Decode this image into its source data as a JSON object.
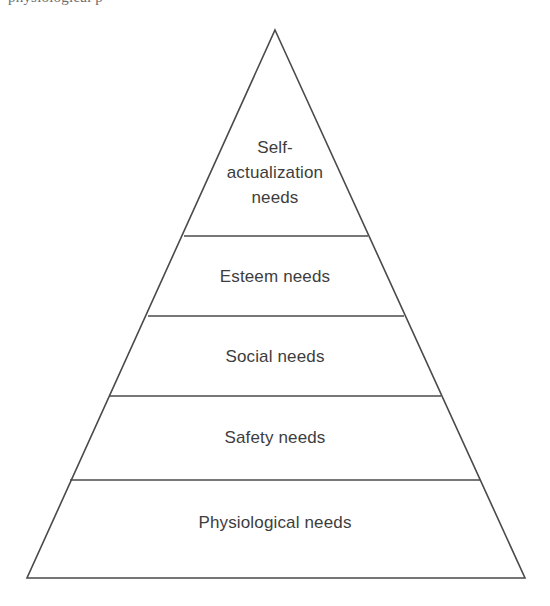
{
  "diagram": {
    "type": "pyramid",
    "top_text_fragment": "physiological p",
    "stroke_color": "#4a4a4a",
    "fill_color": "#ffffff",
    "background_color": "#ffffff",
    "apex": {
      "x": 275,
      "y": 30
    },
    "base_left": {
      "x": 27,
      "y": 578
    },
    "base_right": {
      "x": 525,
      "y": 578
    },
    "tiers": [
      {
        "id": "self-actualization",
        "label": "Self-\nactualization\nneeds",
        "order": 1,
        "level": "top",
        "divider_y": 236,
        "divider_x_start": 184,
        "divider_x_end": 368,
        "label_center_x": 275,
        "label_top_y": 135
      },
      {
        "id": "esteem",
        "label": "Esteem needs",
        "order": 2,
        "level": "fourth",
        "divider_y": 316,
        "divider_x_start": 148,
        "divider_x_end": 404,
        "label_center_x": 275,
        "label_top_y": 265
      },
      {
        "id": "social",
        "label": "Social needs",
        "order": 3,
        "level": "third",
        "divider_y": 396,
        "divider_x_start": 110,
        "divider_x_end": 441,
        "label_center_x": 275,
        "label_top_y": 345
      },
      {
        "id": "safety",
        "label": "Safety needs",
        "order": 4,
        "level": "second",
        "divider_y": 480,
        "divider_x_start": 70,
        "divider_x_end": 480,
        "label_center_x": 275,
        "label_top_y": 426
      },
      {
        "id": "physiological",
        "label": "Physiological needs",
        "order": 5,
        "level": "base",
        "divider_y": null,
        "divider_x_start": null,
        "divider_x_end": null,
        "label_center_x": 275,
        "label_top_y": 511
      }
    ]
  }
}
